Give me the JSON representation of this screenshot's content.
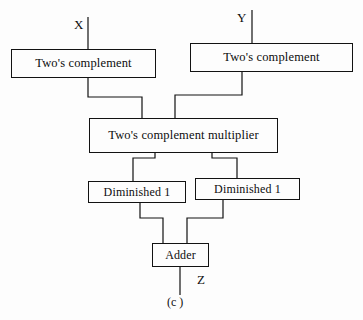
{
  "figure": {
    "caption": "(c )",
    "background_color": "#fdfdfd",
    "line_color": "#121212",
    "text_color": "#0d0d0d"
  },
  "ports": {
    "input_x": "X",
    "input_y": "Y",
    "output_z": "Z"
  },
  "blocks": {
    "twos_complement_x": "Two's complement",
    "twos_complement_y": "Two's complement",
    "multiplier": "Two's complement multiplier",
    "diminished_left": "Diminished 1",
    "diminished_right": "Diminished 1",
    "adder": "Adder"
  },
  "diagram_data": {
    "type": "block-diagram",
    "title": "Two's complement multiplier datapath",
    "nodes": [
      {
        "id": "twos_complement_x",
        "label": "Two's complement",
        "x": 11,
        "y": 49,
        "w": 145,
        "h": 29
      },
      {
        "id": "twos_complement_y",
        "label": "Two's complement",
        "x": 190,
        "y": 43,
        "w": 163,
        "h": 29
      },
      {
        "id": "multiplier",
        "label": "Two's complement multiplier",
        "x": 89,
        "y": 118,
        "w": 189,
        "h": 35
      },
      {
        "id": "diminished_left",
        "label": "Diminished 1",
        "x": 88,
        "y": 181,
        "w": 98,
        "h": 22
      },
      {
        "id": "diminished_right",
        "label": "Diminished 1",
        "x": 195,
        "y": 178,
        "w": 105,
        "h": 22
      },
      {
        "id": "adder",
        "label": "Adder",
        "x": 152,
        "y": 243,
        "w": 57,
        "h": 24
      }
    ],
    "edges": [
      {
        "from": "input_x",
        "to": "twos_complement_x",
        "arrow": true
      },
      {
        "from": "input_y",
        "to": "twos_complement_y",
        "arrow": true
      },
      {
        "from": "twos_complement_x",
        "to": "multiplier",
        "arrow": true
      },
      {
        "from": "twos_complement_y",
        "to": "multiplier",
        "arrow": true
      },
      {
        "from": "multiplier",
        "to": "diminished_left",
        "arrow": false
      },
      {
        "from": "multiplier",
        "to": "diminished_right",
        "arrow": false
      },
      {
        "from": "diminished_left",
        "to": "adder",
        "arrow": false
      },
      {
        "from": "diminished_right",
        "to": "adder",
        "arrow": false
      },
      {
        "from": "adder",
        "to": "output_z",
        "arrow": false
      }
    ]
  }
}
